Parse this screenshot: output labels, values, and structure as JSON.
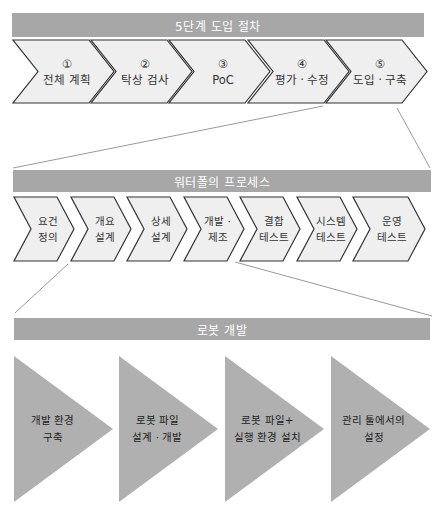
{
  "colors": {
    "bar": "#a7a7a7",
    "chevron_fill": "#efefef",
    "chevron_stroke": "#333333",
    "triangle_fill": "#b0b0b0",
    "connector": "#9a9a9a"
  },
  "section1": {
    "title": "5단계 도입 절차",
    "steps": [
      {
        "num": "①",
        "label": "전체 계획"
      },
      {
        "num": "②",
        "label": "탁상 검사"
      },
      {
        "num": "③",
        "label": "PoC"
      },
      {
        "num": "④",
        "label": "평가 · 수정"
      },
      {
        "num": "⑤",
        "label": "도입 · 구축"
      }
    ]
  },
  "section2": {
    "title": "워터폴의 프로세스",
    "steps": [
      {
        "line1": "요건",
        "line2": "정의"
      },
      {
        "line1": "개요",
        "line2": "설계"
      },
      {
        "line1": "상세",
        "line2": "설계"
      },
      {
        "line1": "개발 ·",
        "line2": "제조"
      },
      {
        "line1": "결합",
        "line2": "테스트"
      },
      {
        "line1": "시스템",
        "line2": "테스트"
      },
      {
        "line1": "운영",
        "line2": "테스트"
      }
    ]
  },
  "section3": {
    "title": "로봇 개발",
    "steps": [
      {
        "line1": "개발 환경",
        "line2": "구축"
      },
      {
        "line1": "로봇 파일",
        "line2": "설계 · 개발"
      },
      {
        "line1": "로봇 파일+",
        "line2": "실행 환경 설치"
      },
      {
        "line1": "관리 툴에서의",
        "line2": "설정"
      }
    ]
  }
}
